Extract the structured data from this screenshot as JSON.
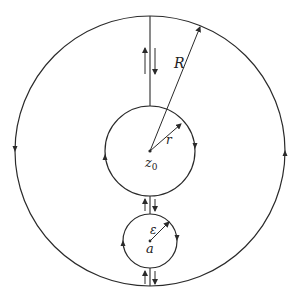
{
  "diagram": {
    "type": "contour-keyhole",
    "stroke_color": "#2a2a2a",
    "background": "#ffffff",
    "outer_circle": {
      "label": "R",
      "cx": 150,
      "cy": 151,
      "r": 135,
      "orientation": "counterclockwise"
    },
    "inner_circle": {
      "label": "r",
      "center_label": "z",
      "center_subscript": "0",
      "cx": 150,
      "cy": 151,
      "r": 45,
      "orientation": "clockwise"
    },
    "small_circle": {
      "label": "ε",
      "center_label": "a",
      "cx": 150,
      "cy": 241,
      "r": 27,
      "orientation": "clockwise"
    },
    "cuts": [
      {
        "name": "top-cut",
        "from": "outer-circle",
        "to": "inner-circle",
        "arrows": [
          "up",
          "down"
        ]
      },
      {
        "name": "middle-cut",
        "from": "inner-circle",
        "to": "small-circle",
        "arrows": [
          "up",
          "down"
        ]
      },
      {
        "name": "bottom-cut",
        "from": "small-circle",
        "to": "outer-circle",
        "arrows": [
          "up",
          "down"
        ]
      }
    ]
  }
}
